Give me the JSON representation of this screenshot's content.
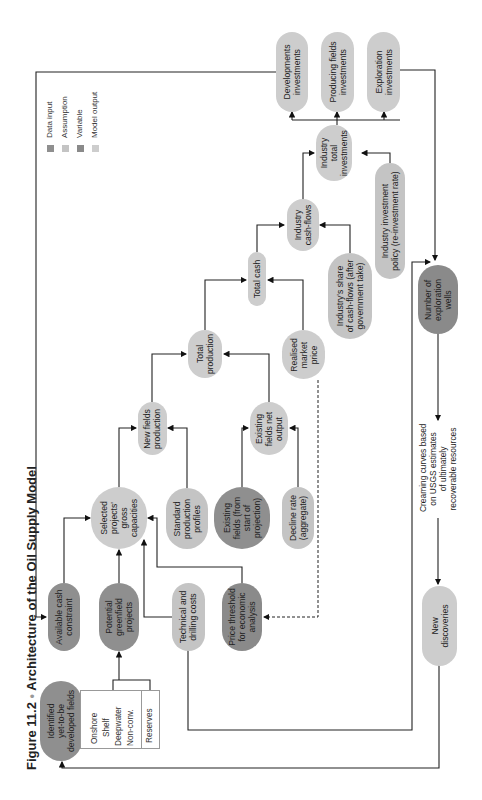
{
  "figure": {
    "number": "Figure 11.2",
    "separator": "•",
    "title": "Architecture of the Oil Supply Model"
  },
  "legend": {
    "items": [
      {
        "label": "Data input",
        "color": "#8f8f8f"
      },
      {
        "label": "Assumption",
        "color": "#c4c4c4"
      },
      {
        "label": "Variable",
        "color": "#8a8a8a"
      },
      {
        "label": "Model output",
        "color": "#cdcdcd"
      }
    ]
  },
  "nodes": {
    "developments_investments": "Developments\ninvestments",
    "producing_fields_investments": "Producing fields\ninvestments",
    "exploration_investments": "Exploration\ninvestments",
    "industry_total_investments": "Industry\ntotal\ninvestments",
    "industry_cash_flows": "Industry\ncash-flows",
    "industry_investment_policy": "Industry investment\npolicy (re-investment rate)",
    "total_cash": "Total cash",
    "industry_share": "Industry's share\nof cash-flows (after\ngovernment take)",
    "number_exploration_wells": "Number of\nexploration\nwells",
    "total_production": "Total\nproduction",
    "realised_market_price": "Realised\nmarket\nprice",
    "new_fields_production": "New fields\nproduction",
    "existing_fields_net_output": "Existing\nfields net\noutput",
    "selected_projects": "Selected\nprojects'\ngross\ncapacities",
    "standard_production_profiles": "Standard\nproduction\nprofiles",
    "existing_fields": "Existing\nfields (from\nstart of\nprojection)",
    "decline_rate": "Decline rate\n(aggregate)",
    "available_cash_constraint": "Available cash\nconstraint",
    "potential_greenfield_projects": "Potential\ngreenfield\nprojects",
    "technical_drilling_costs": "Technical and\ndrilling costs",
    "price_threshold": "Price threshold\nfor economic\nanalysis",
    "identified_fields": "Identified\nyet-to-be\ndeveloped fields",
    "new_discoveries": "New\ndiscoveries"
  },
  "creaming_curves": "Creaming curves based\non USGS estimates\nof ultimately\nrecoverable resources",
  "field_types": {
    "items": [
      "Onshore",
      "Shelf",
      "Deepwater",
      "Non-conv."
    ],
    "reserves": "Reserves"
  }
}
